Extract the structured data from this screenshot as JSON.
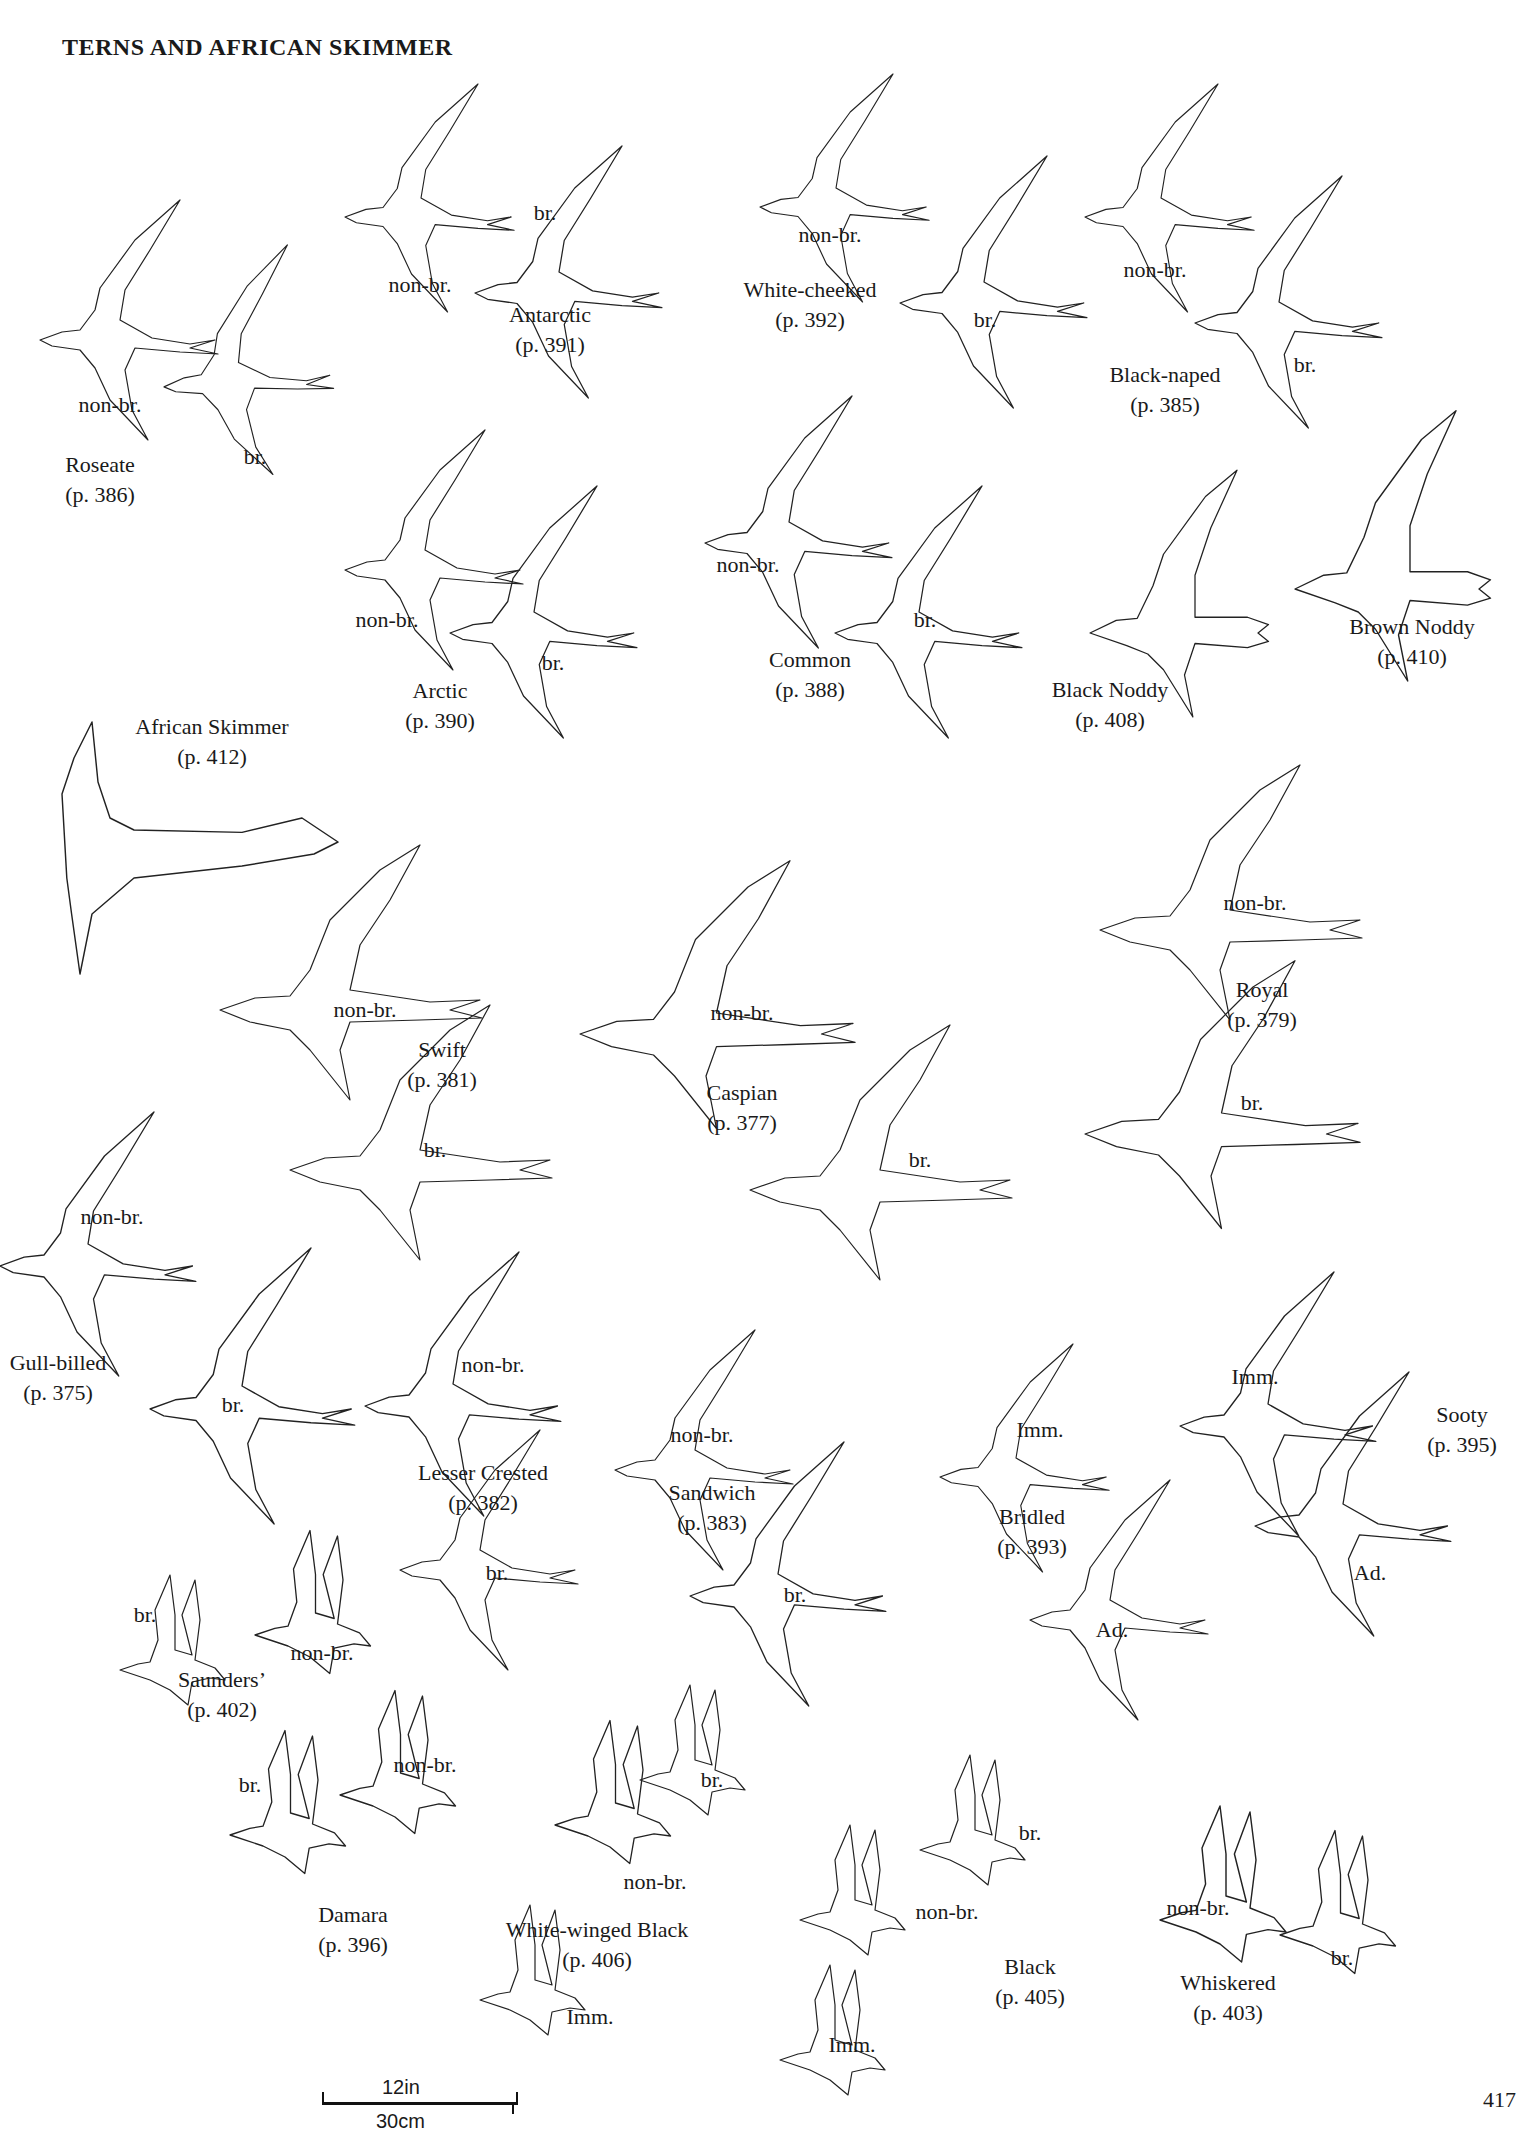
{
  "page": {
    "title": "TERNS AND AFRICAN SKIMMER",
    "page_number": "417",
    "scale_bar": {
      "top_label": "12in",
      "bottom_label": "30cm"
    }
  },
  "species": [
    {
      "id": "roseate",
      "name": "Roseate",
      "page": "(p. 386)",
      "x": 100,
      "y": 450,
      "forms": [
        {
          "label": "non-br.",
          "x": 110,
          "y": 390
        },
        {
          "label": "br.",
          "x": 255,
          "y": 442
        }
      ]
    },
    {
      "id": "antarctic",
      "name": "Antarctic",
      "page": "(p. 391)",
      "x": 550,
      "y": 300,
      "forms": [
        {
          "label": "non-br.",
          "x": 420,
          "y": 270
        },
        {
          "label": "br.",
          "x": 545,
          "y": 198
        }
      ]
    },
    {
      "id": "white-cheeked",
      "name": "White-cheeked",
      "page": "(p. 392)",
      "x": 810,
      "y": 275,
      "forms": [
        {
          "label": "non-br.",
          "x": 830,
          "y": 220
        },
        {
          "label": "br.",
          "x": 985,
          "y": 305
        }
      ]
    },
    {
      "id": "black-naped",
      "name": "Black-naped",
      "page": "(p. 385)",
      "x": 1165,
      "y": 360,
      "forms": [
        {
          "label": "non-br.",
          "x": 1155,
          "y": 255
        },
        {
          "label": "br.",
          "x": 1305,
          "y": 350
        }
      ]
    },
    {
      "id": "arctic",
      "name": "Arctic",
      "page": "(p. 390)",
      "x": 440,
      "y": 676,
      "forms": [
        {
          "label": "non-br.",
          "x": 387,
          "y": 605
        },
        {
          "label": "br.",
          "x": 553,
          "y": 648
        }
      ]
    },
    {
      "id": "common",
      "name": "Common",
      "page": "(p. 388)",
      "x": 810,
      "y": 645,
      "forms": [
        {
          "label": "non-br.",
          "x": 748,
          "y": 550
        },
        {
          "label": "br.",
          "x": 925,
          "y": 605
        }
      ]
    },
    {
      "id": "black-noddy",
      "name": "Black Noddy",
      "page": "(p. 408)",
      "x": 1110,
      "y": 675,
      "forms": []
    },
    {
      "id": "brown-noddy",
      "name": "Brown Noddy",
      "page": "(p. 410)",
      "x": 1412,
      "y": 612,
      "forms": []
    },
    {
      "id": "african-skimmer",
      "name": "African Skimmer",
      "page": "(p. 412)",
      "x": 212,
      "y": 712,
      "forms": []
    },
    {
      "id": "swift",
      "name": "Swift",
      "page": "(p. 381)",
      "x": 442,
      "y": 1035,
      "forms": [
        {
          "label": "non-br.",
          "x": 365,
          "y": 995
        },
        {
          "label": "br.",
          "x": 435,
          "y": 1135
        }
      ]
    },
    {
      "id": "caspian",
      "name": "Caspian",
      "page": "(p. 377)",
      "x": 742,
      "y": 1078,
      "forms": [
        {
          "label": "non-br.",
          "x": 742,
          "y": 998
        },
        {
          "label": "br.",
          "x": 920,
          "y": 1145
        }
      ]
    },
    {
      "id": "royal",
      "name": "Royal",
      "page": "(p. 379)",
      "x": 1262,
      "y": 975,
      "forms": [
        {
          "label": "non-br.",
          "x": 1255,
          "y": 888
        },
        {
          "label": "br.",
          "x": 1252,
          "y": 1088
        }
      ]
    },
    {
      "id": "gull-billed",
      "name": "Gull-billed",
      "page": "(p. 375)",
      "x": 58,
      "y": 1348,
      "forms": [
        {
          "label": "non-br.",
          "x": 112,
          "y": 1202
        },
        {
          "label": "br.",
          "x": 233,
          "y": 1390
        }
      ]
    },
    {
      "id": "lesser-crested",
      "name": "Lesser Crested",
      "page": "(p. 382)",
      "x": 483,
      "y": 1458,
      "forms": [
        {
          "label": "non-br.",
          "x": 493,
          "y": 1350
        },
        {
          "label": "br.",
          "x": 497,
          "y": 1558
        }
      ]
    },
    {
      "id": "sandwich",
      "name": "Sandwich",
      "page": "(p. 383)",
      "x": 712,
      "y": 1478,
      "forms": [
        {
          "label": "non-br.",
          "x": 702,
          "y": 1420
        },
        {
          "label": "br.",
          "x": 795,
          "y": 1580
        }
      ]
    },
    {
      "id": "bridled",
      "name": "Bridled",
      "page": "(p. 393)",
      "x": 1032,
      "y": 1502,
      "forms": [
        {
          "label": "Imm.",
          "x": 1040,
          "y": 1415
        },
        {
          "label": "Ad.",
          "x": 1112,
          "y": 1615
        }
      ]
    },
    {
      "id": "sooty",
      "name": "Sooty",
      "page": "(p. 395)",
      "x": 1462,
      "y": 1400,
      "forms": [
        {
          "label": "Imm.",
          "x": 1255,
          "y": 1362
        },
        {
          "label": "Ad.",
          "x": 1370,
          "y": 1558
        }
      ]
    },
    {
      "id": "saunders",
      "name": "Saunders’",
      "page": "(p. 402)",
      "x": 222,
      "y": 1665,
      "forms": [
        {
          "label": "br.",
          "x": 145,
          "y": 1600
        },
        {
          "label": "non-br.",
          "x": 322,
          "y": 1638
        }
      ]
    },
    {
      "id": "damara",
      "name": "Damara",
      "page": "(p. 396)",
      "x": 353,
      "y": 1900,
      "forms": [
        {
          "label": "br.",
          "x": 250,
          "y": 1770
        },
        {
          "label": "non-br.",
          "x": 425,
          "y": 1750
        }
      ]
    },
    {
      "id": "white-winged-black",
      "name": "White-winged Black",
      "page": "(p. 406)",
      "x": 597,
      "y": 1915,
      "forms": [
        {
          "label": "br.",
          "x": 712,
          "y": 1765
        },
        {
          "label": "non-br.",
          "x": 655,
          "y": 1867
        },
        {
          "label": "Imm.",
          "x": 590,
          "y": 2002
        }
      ]
    },
    {
      "id": "black",
      "name": "Black",
      "page": "(p. 405)",
      "x": 1030,
      "y": 1952,
      "forms": [
        {
          "label": "br.",
          "x": 1030,
          "y": 1818
        },
        {
          "label": "non-br.",
          "x": 947,
          "y": 1897
        },
        {
          "label": "Imm.",
          "x": 852,
          "y": 2030
        }
      ]
    },
    {
      "id": "whiskered",
      "name": "Whiskered",
      "page": "(p. 403)",
      "x": 1228,
      "y": 1968,
      "forms": [
        {
          "label": "non-br.",
          "x": 1198,
          "y": 1893
        },
        {
          "label": "br.",
          "x": 1342,
          "y": 1943
        }
      ]
    }
  ],
  "colors": {
    "ink": "#1a1a1a",
    "paper": "#ffffff"
  }
}
